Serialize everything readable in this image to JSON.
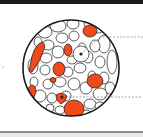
{
  "diagram": {
    "type": "cross-section",
    "colors": {
      "highlight_cell": "#f04a1c",
      "plain_cell": "#ffffff",
      "outline": "#1a1a1a",
      "leader_line": "#666666",
      "top_border": "#1a1a1a",
      "bottom_border": "#8a8a8a"
    },
    "callouts": [
      {
        "id": "upper",
        "target": "white cell with nucleus",
        "label": ""
      },
      {
        "id": "lower",
        "target": "orange cell with nucleus",
        "label": ""
      }
    ]
  }
}
